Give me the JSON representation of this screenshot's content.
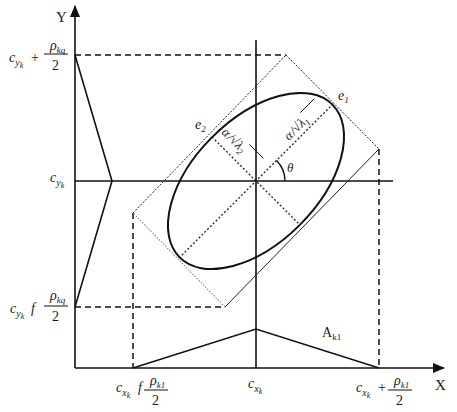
{
  "axes": {
    "x_label": "X",
    "y_label": "Y"
  },
  "y_ticks": {
    "top": {
      "prefix": "c",
      "sub": "y",
      "subsub": "k",
      "op": "+",
      "numerator": "ρ",
      "num_sub": "kq",
      "denominator": "2"
    },
    "mid": {
      "prefix": "c",
      "sub": "y",
      "subsub": "k"
    },
    "bottom": {
      "prefix": "c",
      "sub": "y",
      "subsub": "k",
      "op": "f",
      "numerator": "ρ",
      "num_sub": "kq",
      "denominator": "2"
    }
  },
  "x_ticks": {
    "left": {
      "prefix": "c",
      "sub": "x",
      "subsub": "k",
      "op": "f",
      "numerator": "ρ",
      "num_sub": "k1",
      "denominator": "2"
    },
    "mid": {
      "prefix": "c",
      "sub": "x",
      "subsub": "k"
    },
    "right": {
      "prefix": "c",
      "sub": "x",
      "subsub": "k",
      "op": "+",
      "numerator": "ρ",
      "num_sub": "k1",
      "denominator": "2"
    }
  },
  "annotations": {
    "e1": {
      "base": "e",
      "sub": "1"
    },
    "e2": {
      "base": "e",
      "sub": "2"
    },
    "major_axis": {
      "alpha": "α",
      "slash": "/",
      "sqrt": "√",
      "lambda": "λ",
      "sub": "1"
    },
    "minor_axis": {
      "alpha": "α",
      "slash": "/",
      "sqrt": "√",
      "lambda": "λ",
      "sub": "2"
    },
    "angle": "θ",
    "area": {
      "base": "A",
      "sub": "k1"
    }
  },
  "geometry": {
    "center": [
      256,
      181
    ],
    "rotation_deg": -45,
    "semi_major_px": 108,
    "semi_minor_px": 62,
    "rect_corners": {
      "top": [
        286,
        55
      ],
      "right": [
        379,
        149
      ],
      "bottom": [
        225,
        307
      ],
      "left": [
        133,
        213
      ]
    }
  }
}
